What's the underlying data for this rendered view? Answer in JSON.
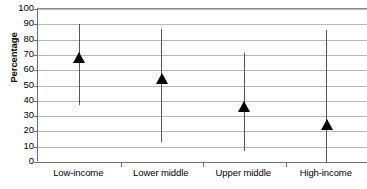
{
  "chart_data": {
    "type": "scatter",
    "title": "",
    "subtitle": "",
    "xlabel": "",
    "ylabel": "Percentage",
    "ylim": [
      0,
      100
    ],
    "ytick_step": 10,
    "ytick_labels": [
      "100",
      "90",
      "80",
      "70",
      "60",
      "50",
      "40",
      "30",
      "20",
      "10",
      "0"
    ],
    "grid": true,
    "legend": "none",
    "marker_style": "filled-up-triangle",
    "marker_color": "#000000",
    "errorbar_color": "#555555",
    "gridline_color": "#b9b9b9",
    "axis_color": "#6d6d6d",
    "categories": [
      "Low-income",
      "Lower middle",
      "Upper middle",
      "High-income"
    ],
    "values": [
      68,
      54,
      36,
      24
    ],
    "error_low": [
      37,
      13,
      7,
      0
    ],
    "error_high": [
      90,
      87,
      71,
      86
    ],
    "series": [
      {
        "name": "Percentage",
        "points": [
          {
            "category": "Low-income",
            "value": 68,
            "low": 37,
            "high": 90
          },
          {
            "category": "Lower middle",
            "value": 54,
            "low": 13,
            "high": 87
          },
          {
            "category": "Upper middle",
            "value": 36,
            "low": 7,
            "high": 71
          },
          {
            "category": "High-income",
            "value": 24,
            "low": 0,
            "high": 86
          }
        ]
      }
    ]
  }
}
